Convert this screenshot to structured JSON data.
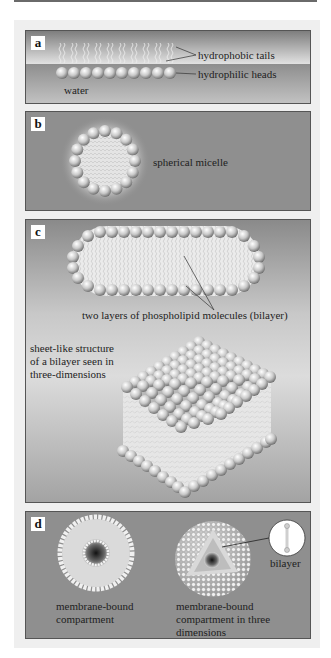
{
  "figure": {
    "panels": [
      {
        "id": "a",
        "letter": "a",
        "labels": {
          "tails": "hydrophobic tails",
          "heads": "hydrophilic heads",
          "medium": "water"
        }
      },
      {
        "id": "b",
        "letter": "b",
        "labels": {
          "structure": "spherical micelle"
        }
      },
      {
        "id": "c",
        "letter": "c",
        "labels": {
          "bilayer": "two layers of phospholipid molecules (bilayer)",
          "sheet_line1": "sheet-like structure",
          "sheet_line2": "of a bilayer seen in",
          "sheet_line3": "three-dimensions"
        }
      },
      {
        "id": "d",
        "letter": "d",
        "labels": {
          "left_line1": "membrane-bound",
          "left_line2": "compartment",
          "right_line1": "membrane-bound",
          "right_line2": "compartment in three",
          "right_line3": "dimensions",
          "callout": "bilayer"
        }
      }
    ],
    "colors": {
      "panel_gray": "#8f8f8f",
      "frame": "#efefef",
      "head_light": "#f4f4f4",
      "head_dark": "#8a8a8a",
      "tails": "#e8e8e8"
    }
  }
}
